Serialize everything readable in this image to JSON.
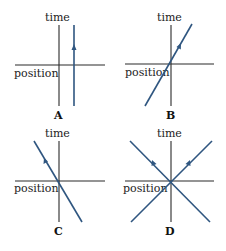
{
  "figure": {
    "axis_labels": {
      "vertical": "time",
      "horizontal": "position"
    },
    "line_color": "#2f5680",
    "axis_color": "#2a2a2a",
    "panels": [
      {
        "id": "A",
        "label": "A",
        "description": "stationary worldline: vertical line offset to the right of the time axis, arrow pointing up",
        "worldlines": [
          {
            "kind": "vertical",
            "direction": "up"
          }
        ]
      },
      {
        "id": "B",
        "label": "B",
        "description": "worldline through origin sloping up to the right, arrow pointing up-right",
        "worldlines": [
          {
            "kind": "slope-right",
            "direction": "up-right"
          }
        ]
      },
      {
        "id": "C",
        "label": "C",
        "description": "worldline through origin sloping up to the left, arrow pointing up-left",
        "worldlines": [
          {
            "kind": "slope-left",
            "direction": "up-left"
          }
        ]
      },
      {
        "id": "D",
        "label": "D",
        "description": "two worldlines crossing at origin, one moving left and one moving right, arrows pointing up",
        "worldlines": [
          {
            "kind": "slope-left",
            "direction": "up-left"
          },
          {
            "kind": "slope-right",
            "direction": "up-right"
          }
        ]
      }
    ]
  }
}
